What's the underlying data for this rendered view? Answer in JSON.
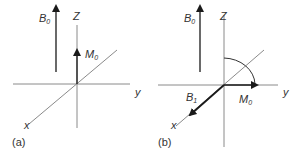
{
  "figure": {
    "panel_a": {
      "caption": "(a)",
      "field_label": "B",
      "field_sub": "0",
      "z_label": "Z",
      "y_label": "y",
      "x_label": "x",
      "magnetization_label": "M",
      "magnetization_sub": "0"
    },
    "panel_b": {
      "caption": "(b)",
      "field_label": "B",
      "field_sub": "0",
      "z_label": "Z",
      "y_label": "y",
      "x_label": "x",
      "magnetization_label": "M",
      "magnetization_sub": "0",
      "rf_label": "B",
      "rf_sub": "1"
    },
    "colors": {
      "axis": "#8a8a8a",
      "arrow": "#1a1a1a",
      "text": "#333333"
    }
  }
}
